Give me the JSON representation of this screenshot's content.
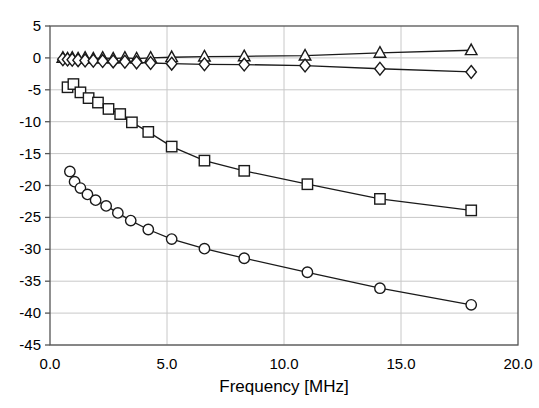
{
  "chart_data": {
    "type": "line",
    "title": "",
    "xlabel": "Frequency [MHz]",
    "ylabel": "",
    "xlim": [
      0.0,
      20.0
    ],
    "ylim": [
      -45,
      5
    ],
    "xticks": [
      "0.0",
      "5.0",
      "10.0",
      "15.0",
      "20.0"
    ],
    "xtick_values": [
      0,
      5,
      10,
      15,
      20
    ],
    "yticks": [
      "5",
      "0",
      "-5",
      "-10",
      "-15",
      "-20",
      "-25",
      "-30",
      "-35",
      "-40",
      "-45"
    ],
    "ytick_values": [
      5,
      0,
      -5,
      -10,
      -15,
      -20,
      -25,
      -30,
      -35,
      -40,
      -45
    ],
    "grid": true,
    "legend": "none",
    "line_color": "#1a1a1a",
    "marker_fill": "#ffffff",
    "series": [
      {
        "name": "triangle-series",
        "marker": "triangle",
        "x": [
          0.55,
          0.75,
          0.95,
          1.2,
          1.5,
          1.85,
          2.25,
          2.7,
          3.2,
          3.7,
          4.3,
          5.2,
          6.6,
          8.3,
          10.9,
          14.1,
          18.0
        ],
        "values": [
          0.0,
          -0.1,
          0.0,
          -0.1,
          0.0,
          -0.1,
          0.0,
          -0.1,
          0.0,
          -0.1,
          0.0,
          0.1,
          0.2,
          0.25,
          0.35,
          0.8,
          1.2
        ]
      },
      {
        "name": "diamond-series",
        "marker": "diamond",
        "x": [
          0.55,
          0.75,
          0.95,
          1.2,
          1.5,
          1.85,
          2.25,
          2.7,
          3.2,
          3.7,
          4.3,
          5.2,
          6.6,
          8.3,
          10.9,
          14.1,
          18.0
        ],
        "values": [
          -0.2,
          -0.25,
          -0.3,
          -0.35,
          -0.4,
          -0.45,
          -0.5,
          -0.55,
          -0.6,
          -0.7,
          -0.8,
          -0.9,
          -1.0,
          -1.05,
          -1.2,
          -1.7,
          -2.2
        ]
      },
      {
        "name": "square-series",
        "marker": "square",
        "x": [
          0.75,
          1.0,
          1.3,
          1.65,
          2.05,
          2.5,
          3.0,
          3.5,
          4.2,
          5.2,
          6.6,
          8.3,
          11.0,
          14.1,
          18.0
        ],
        "values": [
          -4.6,
          -4.1,
          -5.4,
          -6.3,
          -7.0,
          -8.0,
          -8.8,
          -10.1,
          -11.6,
          -13.9,
          -16.1,
          -17.7,
          -19.8,
          -22.1,
          -23.9
        ]
      },
      {
        "name": "circle-series",
        "marker": "circle",
        "x": [
          0.85,
          1.05,
          1.3,
          1.6,
          1.95,
          2.4,
          2.9,
          3.45,
          4.2,
          5.2,
          6.6,
          8.3,
          11.0,
          14.1,
          18.0
        ],
        "values": [
          -17.8,
          -19.4,
          -20.4,
          -21.4,
          -22.3,
          -23.2,
          -24.3,
          -25.5,
          -26.9,
          -28.4,
          -29.9,
          -31.4,
          -33.6,
          -36.1,
          -38.7
        ]
      }
    ]
  }
}
